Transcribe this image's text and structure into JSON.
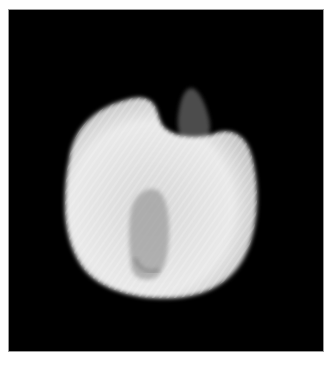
{
  "image": {
    "subject": "X-ray of a rounded seed/fruit with a notched top and stem",
    "background_color": "#000000",
    "frame_color": "#ffffff",
    "specimen_color": "#e6e6e6"
  }
}
